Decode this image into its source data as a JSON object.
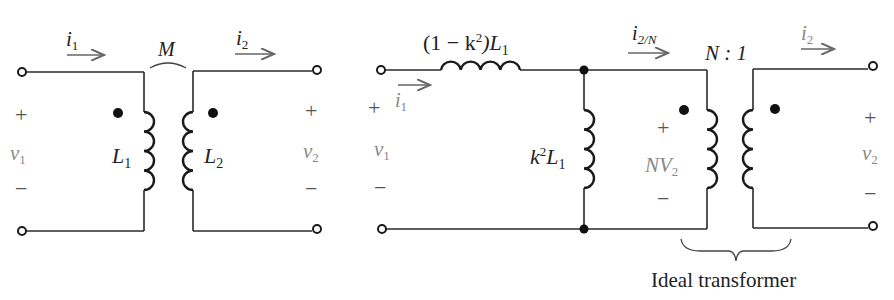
{
  "figure": {
    "left_circuit": {
      "title": "Coupled inductors",
      "current_in": {
        "symbol": "i",
        "sub": "1"
      },
      "current_out": {
        "symbol": "i",
        "sub": "2"
      },
      "mutual": "M",
      "inductor1": {
        "symbol": "L",
        "sub": "1"
      },
      "inductor2": {
        "symbol": "L",
        "sub": "2"
      },
      "v_in": {
        "symbol": "v",
        "sub": "1",
        "plus": "+",
        "minus": "−"
      },
      "v_out": {
        "symbol": "v",
        "sub": "2",
        "plus": "+",
        "minus": "−"
      }
    },
    "right_circuit": {
      "title": "Equivalent circuit",
      "series_inductor": {
        "pre": "(1 − k",
        "sup": "2",
        "mid": ")L",
        "sub": "1"
      },
      "shunt_inductor": {
        "pre": "k",
        "sup": "2",
        "mid": "L",
        "sub": "1"
      },
      "current_in": {
        "symbol": "i",
        "sub": "1"
      },
      "current_mid": {
        "symbol": "i",
        "sub": "2/N"
      },
      "current_out": {
        "symbol": "i",
        "sub": "2"
      },
      "ratio": "N : 1",
      "primary_voltage": {
        "pre": "NV",
        "sub": "2",
        "plus": "+",
        "minus": "−"
      },
      "v_in": {
        "symbol": "v",
        "sub": "1",
        "plus": "+",
        "minus": "−"
      },
      "v_out": {
        "symbol": "v",
        "sub": "2",
        "plus": "+",
        "minus": "−"
      },
      "brace_label": "Ideal transformer"
    }
  }
}
